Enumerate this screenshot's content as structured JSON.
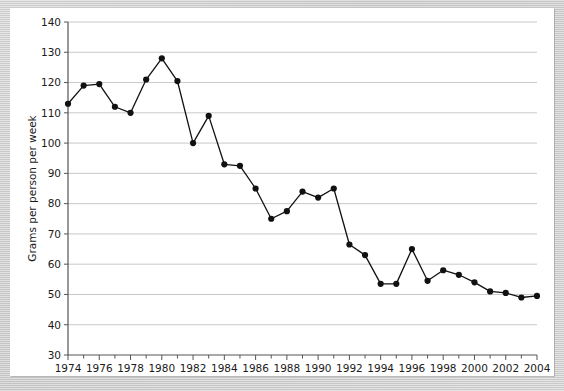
{
  "chart_data": {
    "type": "line",
    "title": "",
    "xlabel": "",
    "ylabel": "Grams per person per week",
    "xlim": [
      1974,
      2004
    ],
    "ylim": [
      30,
      140
    ],
    "ytick_step": 10,
    "xtick_step": 1,
    "xtick_label_step": 2,
    "grid": true,
    "grid_axis": "y",
    "legend": false,
    "legend_position": "none",
    "marker": "filled-circle",
    "line_color": "#111111",
    "marker_color": "#111111",
    "grid_color": "#c9c9c9",
    "axis_color": "#555555",
    "plot_background": "#ffffff",
    "page_background": "#cccccc",
    "x": [
      1974,
      1975,
      1976,
      1977,
      1978,
      1979,
      1980,
      1981,
      1982,
      1983,
      1984,
      1985,
      1986,
      1987,
      1988,
      1989,
      1990,
      1991,
      1992,
      1993,
      1994,
      1995,
      1996,
      1997,
      1998,
      1999,
      2000,
      2001,
      2002,
      2003,
      2004
    ],
    "values": [
      113,
      119,
      119.5,
      112,
      110,
      121,
      128,
      120.5,
      100,
      109,
      93,
      92.5,
      85,
      75,
      77.5,
      84,
      82,
      85,
      66.5,
      63,
      53.5,
      53.5,
      65,
      54.5,
      58,
      56.5,
      54,
      51,
      50.5,
      49,
      49.5
    ],
    "yticks": [
      30,
      40,
      50,
      60,
      70,
      80,
      90,
      100,
      110,
      120,
      130,
      140
    ],
    "ytick_labels": [
      "30",
      "40",
      "50",
      "60",
      "70",
      "80",
      "90",
      "100",
      "110",
      "120",
      "130",
      "140"
    ],
    "xticks": [
      1974,
      1976,
      1978,
      1980,
      1982,
      1984,
      1986,
      1988,
      1990,
      1992,
      1994,
      1996,
      1998,
      2000,
      2002,
      2004
    ],
    "xtick_labels": [
      "1974",
      "1976",
      "1978",
      "1980",
      "1982",
      "1984",
      "1986",
      "1988",
      "1990",
      "1992",
      "1994",
      "1996",
      "1998",
      "2000",
      "2002",
      "2004"
    ]
  }
}
